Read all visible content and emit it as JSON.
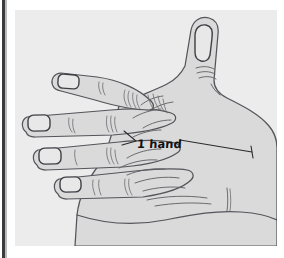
{
  "page": {
    "background_color": "#ffffff",
    "left_rule_color": "#3a3b3d"
  },
  "figure": {
    "name": "hand-span-diagram",
    "panel_background": "#ececec",
    "ink_color": "#4a4a4c",
    "skin_fill": "#dcdcdc",
    "skin_fill_shadow": "#cfcfcf",
    "nail_fill": "#e6e6e6",
    "annotation": {
      "label": "1 hand",
      "measure_from": "base of index finger / web of thumb",
      "measure_to": "outer edge of hand",
      "arrow_style": "double-ended dimension line"
    },
    "parts": [
      {
        "name": "thumb",
        "label": "thumb"
      },
      {
        "name": "index-finger",
        "label": "index finger"
      },
      {
        "name": "middle-finger",
        "label": "middle finger"
      },
      {
        "name": "ring-finger",
        "label": "ring finger"
      },
      {
        "name": "little-finger",
        "label": "little finger"
      },
      {
        "name": "palm",
        "label": "palm"
      },
      {
        "name": "wrist",
        "label": "wrist"
      }
    ]
  }
}
